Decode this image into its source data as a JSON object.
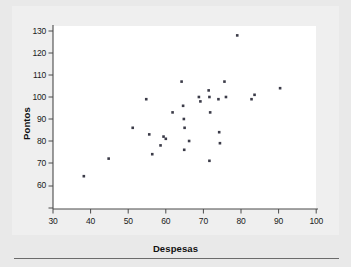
{
  "figure": {
    "background_color": "#e9e9e9",
    "panel_color": "#efefef",
    "plot_area_color": "#ffffff",
    "axis_color": "#4a4a4a",
    "marker_color": "#3b3b48"
  },
  "chart_data": {
    "type": "scatter",
    "title": "",
    "xlabel": "Despesas",
    "ylabel": "Pontos",
    "xlim": [
      30,
      100
    ],
    "ylim": [
      57,
      133
    ],
    "xticks": [
      30,
      40,
      50,
      60,
      70,
      80,
      90,
      100
    ],
    "yticks": [
      60,
      70,
      80,
      90,
      100,
      110,
      120,
      130
    ],
    "xtick_labels": [
      "30",
      "40",
      "50",
      "60",
      "70",
      "80",
      "90",
      "100"
    ],
    "ytick_labels": [
      "60",
      "70",
      "80",
      "90",
      "100",
      "110",
      "120",
      "130"
    ],
    "grid": false,
    "legend": null,
    "points": [
      {
        "x": 38.2,
        "y": 64
      },
      {
        "x": 44.8,
        "y": 72
      },
      {
        "x": 51.2,
        "y": 86
      },
      {
        "x": 54.8,
        "y": 99
      },
      {
        "x": 55.6,
        "y": 83
      },
      {
        "x": 56.4,
        "y": 74
      },
      {
        "x": 58.6,
        "y": 78
      },
      {
        "x": 59.4,
        "y": 82
      },
      {
        "x": 60.0,
        "y": 81
      },
      {
        "x": 61.8,
        "y": 93
      },
      {
        "x": 64.2,
        "y": 107
      },
      {
        "x": 64.6,
        "y": 96
      },
      {
        "x": 64.8,
        "y": 90
      },
      {
        "x": 65.0,
        "y": 86
      },
      {
        "x": 64.9,
        "y": 76
      },
      {
        "x": 66.2,
        "y": 80
      },
      {
        "x": 68.8,
        "y": 100
      },
      {
        "x": 69.2,
        "y": 98
      },
      {
        "x": 71.4,
        "y": 103
      },
      {
        "x": 71.6,
        "y": 100
      },
      {
        "x": 71.8,
        "y": 93
      },
      {
        "x": 71.6,
        "y": 71
      },
      {
        "x": 74.0,
        "y": 99
      },
      {
        "x": 74.2,
        "y": 84
      },
      {
        "x": 74.4,
        "y": 79
      },
      {
        "x": 75.6,
        "y": 107
      },
      {
        "x": 76.0,
        "y": 100
      },
      {
        "x": 79.0,
        "y": 128
      },
      {
        "x": 82.8,
        "y": 99
      },
      {
        "x": 83.6,
        "y": 101
      },
      {
        "x": 90.4,
        "y": 104
      }
    ]
  },
  "axes": {
    "y_axis_name": "Pontos",
    "x_axis_name": "Despesas"
  }
}
